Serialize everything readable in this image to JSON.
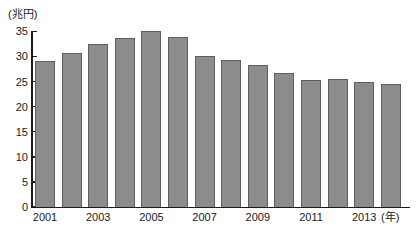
{
  "chart_data": {
    "type": "bar",
    "title": "",
    "subtitle": "",
    "xlabel": "(年)",
    "ylabel": "(兆円)",
    "unit_note_y": "(兆円)",
    "unit_note_x": "(年)",
    "categories": [
      "2001",
      "2002",
      "2003",
      "2004",
      "2005",
      "2006",
      "2007",
      "2008",
      "2009",
      "2010",
      "2011",
      "2012",
      "2013",
      "2014"
    ],
    "values": [
      29.1,
      30.6,
      32.5,
      33.7,
      35.0,
      33.9,
      30.1,
      29.2,
      28.3,
      26.8,
      25.4,
      25.5,
      25.0,
      24.6
    ],
    "tick_labels_x": [
      "2001",
      "2003",
      "2005",
      "2007",
      "2009",
      "2011",
      "2013"
    ],
    "ylim": [
      0,
      35
    ],
    "yticks": [
      0,
      5,
      10,
      15,
      20,
      25,
      30,
      35
    ],
    "ytick_labels": [
      "0",
      "5",
      "10",
      "15",
      "20",
      "25",
      "30",
      "35"
    ],
    "grid": false,
    "legend": null,
    "legend_position": "none",
    "series_color": "#8c8c8c",
    "series_border_color": "#5e5e5e",
    "axis_color": "#1a1a1a",
    "background": "#ffffff"
  }
}
